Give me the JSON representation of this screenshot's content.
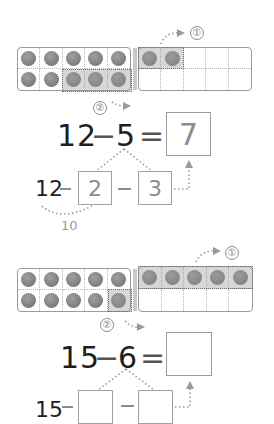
{
  "problems": [
    {
      "id": 1,
      "left_frame": {
        "filled": 10,
        "highlighted_bottom_right": 3
      },
      "right_frame": {
        "filled": 2,
        "highlighted_top_left": 2
      },
      "step_labels": {
        "step1": "①",
        "step2": "②"
      },
      "equation": {
        "minuend": "12",
        "operator": "−",
        "subtrahend": "5",
        "equals": "=",
        "answer": "7"
      },
      "decomposition": {
        "start": "12",
        "operator": "−",
        "part1": "2",
        "part2": "3",
        "ten_label": "10"
      }
    },
    {
      "id": 2,
      "left_frame": {
        "filled": 10,
        "highlighted_bottom_right": 1
      },
      "right_frame": {
        "filled": 5,
        "highlighted_top_row": 5
      },
      "step_labels": {
        "step1": "①",
        "step2": "②"
      },
      "equation": {
        "minuend": "15",
        "operator": "−",
        "subtrahend": "6",
        "equals": "=",
        "answer": ""
      },
      "decomposition": {
        "start": "15",
        "operator": "−",
        "part1": "",
        "part2": ""
      }
    }
  ],
  "colors": {
    "counter": "#8a8a8a",
    "frame_border": "#9a9a9a",
    "highlight": "#b4b4b4",
    "arrow": "#9a9a9a",
    "text": "#1e1e1e",
    "answer_text": "#8c8c8c"
  }
}
